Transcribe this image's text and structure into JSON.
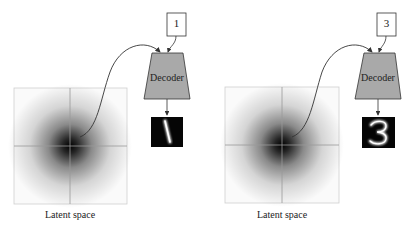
{
  "panels": [
    {
      "input_label": "1",
      "decoder_label": "Decoder",
      "output_digit": "1",
      "caption": "Latent space",
      "latent_box": {
        "x": 14,
        "y": 88,
        "w": 113,
        "h": 116
      },
      "origin": {
        "x": 70,
        "y": 146
      },
      "sample_point": {
        "x": 80,
        "y": 137
      },
      "input_box": {
        "x": 167,
        "y": 13,
        "w": 19,
        "h": 23
      },
      "decoder": {
        "top_y": 53,
        "bottom_y": 99,
        "top_l": 152,
        "top_r": 183,
        "bot_l": 144,
        "bot_r": 190
      },
      "output_image": {
        "x": 151,
        "y": 117,
        "w": 32,
        "h": 30
      }
    },
    {
      "input_label": "3",
      "decoder_label": "Decoder",
      "output_digit": "3",
      "caption": "Latent space",
      "latent_box": {
        "x": 225,
        "y": 87,
        "w": 114,
        "h": 116
      },
      "origin": {
        "x": 282,
        "y": 145
      },
      "sample_point": {
        "x": 292,
        "y": 137
      },
      "input_box": {
        "x": 377,
        "y": 13,
        "w": 19,
        "h": 23
      },
      "decoder": {
        "top_y": 53,
        "bottom_y": 99,
        "top_l": 364,
        "top_r": 395,
        "bot_l": 355,
        "bot_r": 401
      },
      "output_image": {
        "x": 362,
        "y": 117,
        "w": 33,
        "h": 31
      }
    }
  ],
  "colors": {
    "decoder_fill": "#a9a9a9",
    "axis": "#9a9a9a",
    "box_border": "#c8c8c8",
    "output_bg": "#050505",
    "curve": "#333333"
  }
}
